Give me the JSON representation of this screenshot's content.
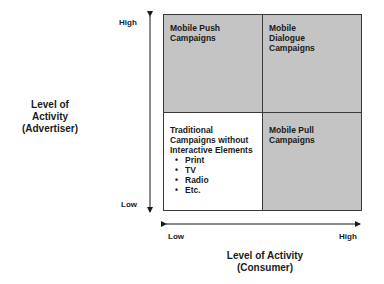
{
  "diagram": {
    "quadrants": {
      "top_left": {
        "lines": [
          "Mobile Push",
          "Campaigns"
        ]
      },
      "top_right": {
        "lines": [
          "Mobile",
          "Dialogue",
          "Campaigns"
        ]
      },
      "bottom_left": {
        "lines": [
          "Traditional",
          "Campaigns without",
          "Interactive Elements"
        ],
        "bullets": [
          "Print",
          "TV",
          "Radio",
          "Etc."
        ]
      },
      "bottom_right": {
        "lines": [
          "Mobile Pull Campaigns"
        ]
      }
    },
    "y_axis": {
      "high_label": "High",
      "low_label": "Low",
      "title_lines": [
        "Level of",
        "Activity",
        "(Advertiser)"
      ]
    },
    "x_axis": {
      "low_label": "Low",
      "high_label": "High",
      "title_lines": [
        "Level of Activity",
        "(Consumer)"
      ]
    },
    "colors": {
      "shaded_quadrant": "#c4c4c4",
      "unshaded_quadrant": "#ffffff",
      "lines": "#1a1a1a"
    }
  }
}
